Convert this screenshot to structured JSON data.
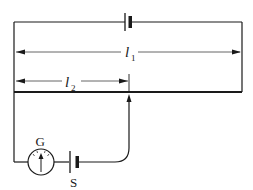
{
  "diagram": {
    "type": "potentiometer circuit",
    "colors": {
      "stroke": "#1a1a1a",
      "background": "#ffffff"
    },
    "labels": {
      "l1": "l",
      "l1_sub": "1",
      "l2": "l",
      "l2_sub": "2",
      "galvanometer": "G",
      "cell": "S"
    },
    "components": [
      {
        "name": "driver-battery",
        "position": "top wire"
      },
      {
        "name": "potentiometer-wire",
        "position": "bottom of main loop"
      },
      {
        "name": "galvanometer",
        "label": "G"
      },
      {
        "name": "test-cell",
        "label": "S"
      },
      {
        "name": "jockey",
        "position": "contact at length l2"
      }
    ],
    "dimensions": [
      {
        "name": "l1",
        "description": "full wire length"
      },
      {
        "name": "l2",
        "description": "balance length"
      }
    ]
  }
}
